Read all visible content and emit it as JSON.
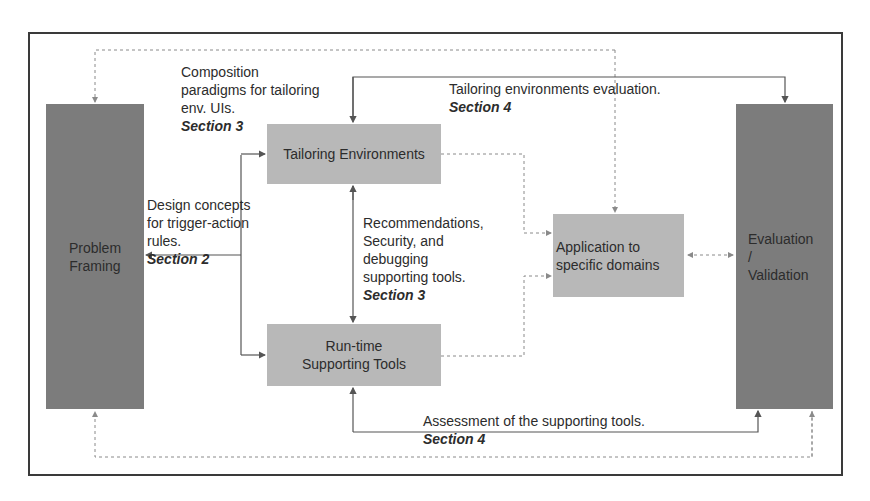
{
  "diagram": {
    "boxes": {
      "problem_framing": "Problem\nFraming",
      "tailoring_environments": "Tailoring Environments",
      "runtime_tools": "Run-time\nSupporting Tools",
      "application_domains": "Application to\nspecific  domains",
      "evaluation_validation": "Evaluation\n/\nValidation"
    },
    "annotations": {
      "composition": {
        "text": "Composition\nparadigms for tailoring\nenv. UIs.",
        "section": "Section 3"
      },
      "tailoring_eval": {
        "text": "Tailoring environments evaluation.",
        "section": "Section 4"
      },
      "design_concepts": {
        "text": "Design concepts\nfor trigger-action\nrules.",
        "section": "Section 2"
      },
      "recommendations": {
        "text": "Recommendations,\nSecurity, and\ndebugging\nsupporting tools.",
        "section": "Section 3"
      },
      "assessment": {
        "text": "Assessment of the supporting tools.",
        "section": "Section 4"
      }
    },
    "colors": {
      "dark_box": "#7c7c7c",
      "light_box": "#b8b8b8",
      "line": "#555555",
      "dashed_line": "#8a8a8a"
    }
  }
}
